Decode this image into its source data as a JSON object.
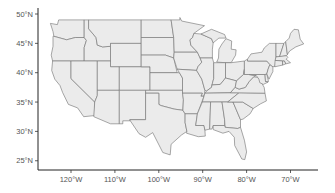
{
  "map": {
    "type": "choropleth-outline",
    "region": "Contiguous United States",
    "fill_color": "#ebebeb",
    "border_color": "#6f6f6f",
    "background": "#ffffff",
    "y_axis": {
      "ticks": [
        {
          "value": 50,
          "label": "50°N"
        },
        {
          "value": 45,
          "label": "45°N"
        },
        {
          "value": 40,
          "label": "40°N"
        },
        {
          "value": 35,
          "label": "35°N"
        },
        {
          "value": 30,
          "label": "30°N"
        },
        {
          "value": 25,
          "label": "25°N"
        }
      ]
    },
    "x_axis": {
      "ticks": [
        {
          "value": -120,
          "label": "120°W"
        },
        {
          "value": -110,
          "label": "110°W"
        },
        {
          "value": -100,
          "label": "100°W"
        },
        {
          "value": -90,
          "label": "90°W"
        },
        {
          "value": -80,
          "label": "80°W"
        },
        {
          "value": -70,
          "label": "70°W"
        }
      ]
    }
  }
}
